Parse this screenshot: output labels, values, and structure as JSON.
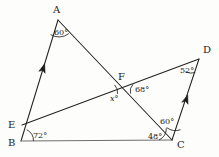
{
  "figure": {
    "background_color": "#fdfdfc",
    "line_color": "#222222",
    "baseline_color": "#6f6f6f"
  },
  "points": {
    "A": {
      "label": "A",
      "x": 58,
      "y": 20,
      "label_x": 53,
      "label_y": 13
    },
    "B": {
      "label": "B",
      "x": 21,
      "y": 141,
      "label_x": 8,
      "label_y": 146
    },
    "C": {
      "label": "C",
      "x": 172,
      "y": 140,
      "label_x": 177,
      "label_y": 148
    },
    "D": {
      "label": "D",
      "x": 199,
      "y": 59,
      "label_x": 203,
      "label_y": 53
    },
    "E": {
      "label": "E",
      "x": 22,
      "y": 125,
      "label_x": 8,
      "label_y": 128
    },
    "F": {
      "label": "F",
      "x": 124,
      "y": 86,
      "label_x": 118,
      "label_y": 80
    }
  },
  "segments": [
    {
      "name": "segment-B-A",
      "from": "B",
      "to": "A",
      "style": "dark"
    },
    {
      "name": "segment-A-C",
      "from": "A",
      "to": "C",
      "style": "dark"
    },
    {
      "name": "segment-B-C",
      "from": "B",
      "to": "C",
      "style": "base"
    },
    {
      "name": "segment-E-D",
      "from": "E",
      "to": "D",
      "style": "dark"
    },
    {
      "name": "segment-C-D",
      "from": "C",
      "to": "D",
      "style": "dark"
    }
  ],
  "parallel_marks": [
    {
      "name": "parallel-mark-BA",
      "on": "segment-B-A",
      "x": 43,
      "y": 69,
      "angle": -72
    },
    {
      "name": "parallel-mark-CD",
      "on": "segment-C-D",
      "x": 186,
      "y": 100,
      "angle": -71.5
    }
  ],
  "angles": [
    {
      "name": "angle-at-A",
      "vertex": "A",
      "value": "60°",
      "label_x": 54,
      "label_y": 35
    },
    {
      "name": "angle-at-B",
      "vertex": "B",
      "value": "72°",
      "label_x": 33,
      "label_y": 138
    },
    {
      "name": "angle-at-C-base",
      "vertex": "C",
      "value": "48°",
      "label_x": 148,
      "label_y": 139
    },
    {
      "name": "angle-at-C-upper",
      "vertex": "C",
      "value": "60°",
      "label_x": 160,
      "label_y": 124
    },
    {
      "name": "angle-at-D",
      "vertex": "D",
      "value": "52°",
      "label_x": 180,
      "label_y": 73
    },
    {
      "name": "angle-at-F-upper",
      "vertex": "F",
      "value": "68°",
      "label_x": 135,
      "label_y": 92
    },
    {
      "name": "angle-at-F-unknown",
      "vertex": "F",
      "value": "x°",
      "label_x": 110,
      "label_y": 101
    }
  ],
  "angle_arcs": [
    {
      "name": "arc-at-A",
      "d": "M 50.6 34.6 A 16 16 0 0 0 68.8 33.6"
    },
    {
      "name": "arc-at-B",
      "d": "M 33.5 141 A 12.5 12.5 0 0 0 26.7 129.7"
    },
    {
      "name": "arc-at-C-base",
      "d": "M 159 140 A 13 13 0 0 0 166.3 128.2"
    },
    {
      "name": "arc-at-C-upper",
      "d": "M 166.7 127.6 A 15 15 0 0 0 180.6 129.7"
    },
    {
      "name": "arc-at-D",
      "d": "M 185.6 71.8 A 14 14 0 0 0 195.2 72.6"
    },
    {
      "name": "arc-at-F-upper",
      "d": "M 133 84.3 A 10 10 0 0 0 130.6 93.6"
    },
    {
      "name": "arc-at-F-unknown",
      "d": "M 117.6 93.9 A 10.5 10.5 0 0 0 114.5 84.9"
    }
  ]
}
